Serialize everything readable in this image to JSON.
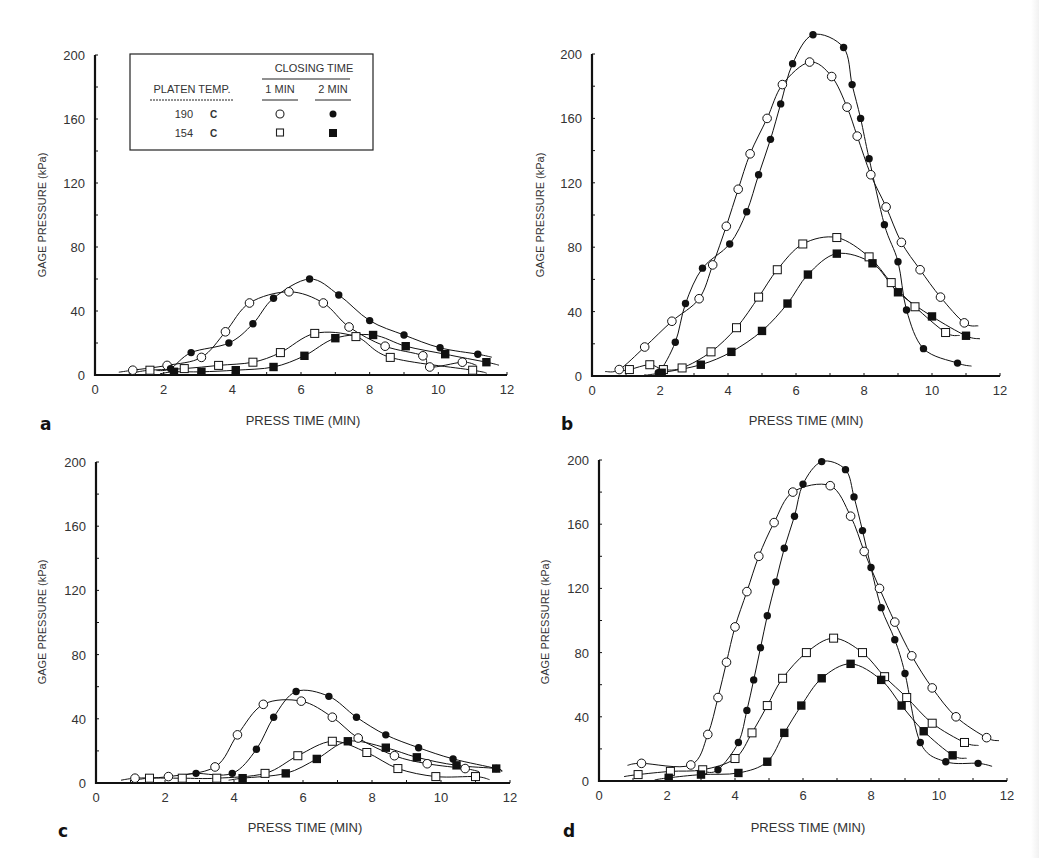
{
  "figure": {
    "legend": {
      "platen_temp_label": "PLATEN TEMP.",
      "closing_time_label": "CLOSING TIME",
      "col_1_label": "1 MIN",
      "col_2_label": "2 MIN",
      "rows": [
        {
          "temp": "190",
          "unit": "C",
          "one_min_marker": "open-circle",
          "two_min_marker": "filled-circle"
        },
        {
          "temp": "154",
          "unit": "C",
          "one_min_marker": "open-square",
          "two_min_marker": "filled-square"
        }
      ]
    }
  },
  "chart_data": [
    {
      "panel": "a",
      "type": "line",
      "title": "",
      "xlabel": "PRESS TIME (MIN)",
      "ylabel": "GAGE PRESSURE (kPa)",
      "xlim": [
        0,
        12
      ],
      "ylim": [
        0,
        200
      ],
      "xticks": [
        0,
        2,
        4,
        6,
        8,
        10,
        12
      ],
      "yticks": [
        0,
        40,
        80,
        120,
        160,
        200
      ],
      "grid": false,
      "legend_position": "upper-left inset",
      "series": [
        {
          "name": "190 C, 1 MIN",
          "marker": "open-circle",
          "x": [
            1.1,
            2.1,
            3.1,
            3.8,
            4.5,
            5.65,
            6.65,
            7.4,
            8.45,
            9.55,
            9.75,
            10.7
          ],
          "y": [
            3,
            6,
            11,
            27,
            45,
            52,
            45,
            30,
            18,
            12,
            5,
            8
          ]
        },
        {
          "name": "190 C, 2 MIN",
          "marker": "filled-circle",
          "x": [
            2.2,
            2.8,
            3.9,
            4.6,
            5.2,
            6.25,
            7.1,
            8.0,
            9.0,
            10.05,
            11.15
          ],
          "y": [
            4,
            14,
            20,
            32,
            48,
            60,
            50,
            34,
            25,
            17,
            13
          ]
        },
        {
          "name": "154 C, 1 MIN",
          "marker": "open-square",
          "x": [
            1.6,
            2.6,
            3.6,
            4.6,
            5.4,
            6.4,
            7.6,
            8.6,
            11.0
          ],
          "y": [
            3,
            4,
            6,
            8,
            14,
            26,
            24,
            11,
            3
          ]
        },
        {
          "name": "154 C, 2 MIN",
          "marker": "filled-square",
          "x": [
            2.3,
            3.1,
            4.1,
            5.2,
            6.1,
            7.0,
            8.1,
            9.05,
            10.2,
            11.4
          ],
          "y": [
            2,
            2,
            3,
            5,
            12,
            23,
            25,
            18,
            13,
            8
          ]
        }
      ]
    },
    {
      "panel": "b",
      "type": "line",
      "title": "",
      "xlabel": "PRESS TIME (MIN)",
      "ylabel": "GAGE PRESSURE (kPa)",
      "xlim": [
        0,
        12
      ],
      "ylim": [
        0,
        200
      ],
      "xticks": [
        0,
        2,
        4,
        6,
        8,
        10,
        12
      ],
      "yticks": [
        0,
        40,
        80,
        120,
        160,
        200
      ],
      "grid": false,
      "series": [
        {
          "name": "190 C, 1 MIN",
          "marker": "open-circle",
          "x": [
            0.8,
            1.55,
            2.35,
            3.15,
            3.55,
            3.95,
            4.3,
            4.65,
            5.15,
            5.6,
            6.4,
            7.05,
            7.5,
            7.8,
            8.2,
            8.65,
            9.1,
            9.65,
            10.25,
            10.95
          ],
          "y": [
            4,
            18,
            34,
            48,
            69,
            93,
            116,
            138,
            160,
            181,
            195,
            186,
            167,
            149,
            125,
            105,
            83,
            66,
            49,
            33
          ]
        },
        {
          "name": "190 C, 2 MIN",
          "marker": "filled-circle",
          "x": [
            1.95,
            2.45,
            2.75,
            3.25,
            4.05,
            4.55,
            4.9,
            5.25,
            5.55,
            5.9,
            6.5,
            7.4,
            7.65,
            7.9,
            8.15,
            8.6,
            9.0,
            9.25,
            9.75,
            10.75
          ],
          "y": [
            2,
            21,
            45,
            67,
            82,
            102,
            125,
            147,
            169,
            194,
            212,
            204,
            181,
            160,
            135,
            94,
            71,
            41,
            17,
            8
          ]
        },
        {
          "name": "154 C, 1 MIN",
          "marker": "open-square",
          "x": [
            1.1,
            1.7,
            2.1,
            2.65,
            3.5,
            4.25,
            4.9,
            5.45,
            6.2,
            7.2,
            8.15,
            8.8,
            9.5,
            10.4
          ],
          "y": [
            4,
            7,
            4,
            5,
            15,
            30,
            49,
            66,
            82,
            86,
            74,
            58,
            43,
            27
          ]
        },
        {
          "name": "154 C, 2 MIN",
          "marker": "filled-square",
          "x": [
            2.05,
            3.2,
            4.1,
            5.0,
            5.75,
            6.35,
            7.2,
            8.25,
            9.0,
            10.0,
            11.0
          ],
          "y": [
            2,
            7,
            15,
            28,
            45,
            63,
            76,
            70,
            52,
            37,
            25
          ]
        }
      ]
    },
    {
      "panel": "c",
      "type": "line",
      "title": "",
      "xlabel": "PRESS TIME (MIN)",
      "ylabel": "GAGE PRESSURE (kPa)",
      "xlim": [
        0,
        12
      ],
      "ylim": [
        0,
        200
      ],
      "xticks": [
        0,
        2,
        4,
        6,
        8,
        10,
        12
      ],
      "yticks": [
        0,
        40,
        80,
        120,
        160,
        200
      ],
      "grid": false,
      "series": [
        {
          "name": "190 C, 1 MIN",
          "marker": "open-circle",
          "x": [
            1.13,
            2.1,
            3.45,
            4.1,
            4.85,
            5.95,
            6.85,
            7.6,
            8.65,
            9.6,
            10.7
          ],
          "y": [
            3,
            4,
            10,
            30,
            49,
            51,
            41,
            28,
            17,
            12,
            9
          ]
        },
        {
          "name": "190 C, 2 MIN",
          "marker": "filled-circle",
          "x": [
            2.9,
            3.95,
            4.65,
            5.15,
            5.8,
            6.75,
            7.55,
            8.4,
            9.35,
            10.35,
            11.6
          ],
          "y": [
            6,
            6,
            21,
            41,
            57,
            54,
            41,
            30,
            22,
            15,
            9
          ]
        },
        {
          "name": "154 C, 1 MIN",
          "marker": "open-square",
          "x": [
            1.55,
            2.5,
            3.5,
            4.9,
            5.85,
            6.85,
            7.85,
            8.75,
            9.85,
            11.0
          ],
          "y": [
            3,
            3,
            3,
            6,
            17,
            26,
            19,
            9,
            4,
            4
          ]
        },
        {
          "name": "154 C, 2 MIN",
          "marker": "filled-square",
          "x": [
            4.25,
            5.5,
            6.4,
            7.3,
            8.4,
            9.3,
            10.45,
            11.6
          ],
          "y": [
            3,
            6,
            15,
            26,
            22,
            16,
            11,
            9
          ]
        }
      ]
    },
    {
      "panel": "d",
      "type": "line",
      "title": "",
      "xlabel": "PRESS TIME (MIN)",
      "ylabel": "GAGE PRESSURE (kPa)",
      "xlim": [
        0,
        12
      ],
      "ylim": [
        0,
        200
      ],
      "xticks": [
        0,
        2,
        4,
        6,
        8,
        10,
        12
      ],
      "yticks": [
        0,
        40,
        80,
        120,
        160,
        200
      ],
      "grid": false,
      "series": [
        {
          "name": "190 C, 1 MIN",
          "marker": "open-circle",
          "x": [
            1.25,
            2.7,
            3.2,
            3.5,
            3.75,
            4.0,
            4.35,
            4.7,
            5.15,
            5.7,
            6.8,
            7.4,
            7.8,
            8.25,
            8.7,
            9.2,
            9.8,
            10.5,
            11.4
          ],
          "y": [
            11,
            10,
            29,
            52,
            74,
            96,
            118,
            140,
            161,
            180,
            184,
            165,
            143,
            120,
            99,
            78,
            58,
            40,
            27
          ]
        },
        {
          "name": "190 C, 2 MIN",
          "marker": "filled-circle",
          "x": [
            3.5,
            4.1,
            4.35,
            4.55,
            4.75,
            4.95,
            5.2,
            5.45,
            5.75,
            6.0,
            6.55,
            7.25,
            7.5,
            7.75,
            8.0,
            8.3,
            8.7,
            9.0,
            9.45,
            10.2,
            11.15
          ],
          "y": [
            7,
            24,
            44,
            63,
            83,
            103,
            124,
            145,
            165,
            185,
            199,
            194,
            177,
            156,
            133,
            108,
            88,
            67,
            24,
            12,
            11
          ]
        },
        {
          "name": "154 C, 1 MIN",
          "marker": "open-square",
          "x": [
            1.15,
            2.1,
            3.05,
            4.0,
            4.5,
            4.95,
            5.4,
            6.1,
            6.9,
            7.75,
            8.4,
            9.05,
            9.8,
            10.75
          ],
          "y": [
            4,
            6,
            7,
            14,
            30,
            47,
            64,
            80,
            89,
            80,
            65,
            52,
            36,
            24
          ]
        },
        {
          "name": "154 C, 2 MIN",
          "marker": "filled-square",
          "x": [
            2.05,
            3.0,
            4.1,
            4.95,
            5.45,
            5.95,
            6.55,
            7.4,
            8.3,
            8.9,
            9.55,
            10.4
          ],
          "y": [
            2,
            4,
            5,
            12,
            30,
            47,
            64,
            73,
            63,
            47,
            31,
            16
          ]
        }
      ]
    }
  ],
  "panels": [
    {
      "letter": "a",
      "xlabel": "PRESS TIME (MIN)",
      "ylabel": "GAGE PRESSURE (kPa)"
    },
    {
      "letter": "b",
      "xlabel": "PRESS TIME (MIN)",
      "ylabel": "GAGE PRESSURE (kPa)"
    },
    {
      "letter": "c",
      "xlabel": "PRESS TIME (MIN)",
      "ylabel": "GAGE PRESSURE (kPa)"
    },
    {
      "letter": "d",
      "xlabel": "PRESS TIME (MIN)",
      "ylabel": "GAGE PRESSURE (kPa)"
    }
  ],
  "colors": {
    "ink": "#111111",
    "label": "#333333",
    "background": "#ffffff"
  }
}
